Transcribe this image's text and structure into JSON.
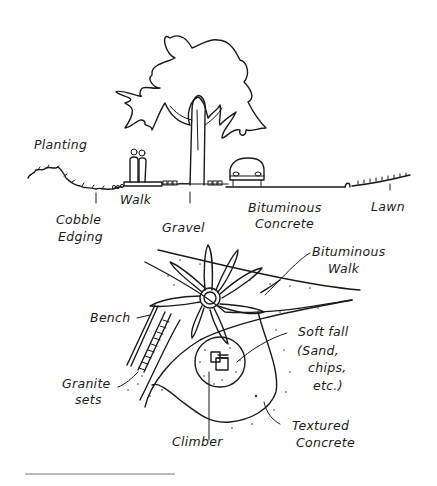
{
  "section": {
    "title": "Street section elevation",
    "labels": {
      "planting": "Planting",
      "cobble_edging_1": "Cobble",
      "cobble_edging_2": "Edging",
      "walk": "Walk",
      "gravel": "Gravel",
      "bituminous_concrete_1": "Bituminous",
      "bituminous_concrete_2": "Concrete",
      "lawn": "Lawn"
    }
  },
  "plan": {
    "title": "Play area plan",
    "labels": {
      "bituminous_walk_1": "Bituminous",
      "bituminous_walk_2": "Walk",
      "bench": "Bench",
      "granite_sets_1": "Granite",
      "granite_sets_2": "sets",
      "soft_fall_1": "Soft fall",
      "soft_fall_2": "(Sand,",
      "soft_fall_3": "chips,",
      "soft_fall_4": "etc.)",
      "climber": "Climber",
      "textured_concrete_1": "Textured",
      "textured_concrete_2": "Concrete"
    }
  },
  "colors": {
    "ink": "#1a1a1a",
    "paper": "#ffffff"
  }
}
